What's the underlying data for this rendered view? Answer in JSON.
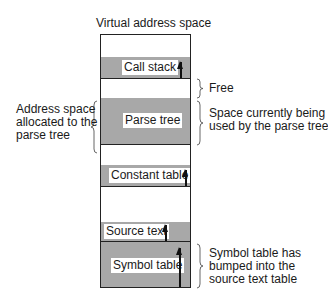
{
  "diagram": {
    "title": "Virtual address space",
    "segments": [
      {
        "label": "Call stack",
        "has_arrow": true
      },
      {
        "label": "Parse tree",
        "has_arrow": false
      },
      {
        "label": "Constant table",
        "has_arrow": true
      },
      {
        "label": "Source text",
        "has_arrow": true
      },
      {
        "label": "Symbol table",
        "has_arrow": true
      }
    ],
    "annotations": {
      "free": "Free",
      "allocated_line1": "Address space",
      "allocated_line2": "allocated to the",
      "allocated_line3": "parse tree",
      "used_line1": "Space currently being",
      "used_line2": "used by the parse tree",
      "symbol_line1": "Symbol table has",
      "symbol_line2": "bumped into the",
      "symbol_line3": "source text table"
    },
    "colors": {
      "shaded": "#a8a8a8",
      "border": "#222222",
      "background": "#ffffff"
    }
  }
}
